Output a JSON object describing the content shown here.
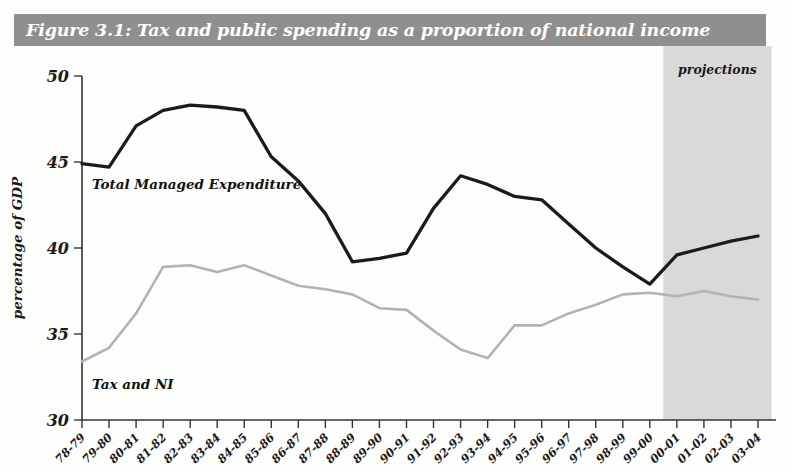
{
  "title": "Figure 3.1: Tax and public spending as a proportion of national income",
  "annotations": {
    "projections": "projections",
    "series_label_tme": "Total Managed Expenditure",
    "series_label_tax": "Tax and NI"
  },
  "colors": {
    "title_band": "#8f8f8f",
    "title_text": "#ffffff",
    "tme_line": "#1b1b1b",
    "tax_line": "#b3b3b3",
    "projection_band": "#d9d9d9",
    "axis": "#333333"
  },
  "chart_data": {
    "type": "line",
    "title": "Figure 3.1: Tax and public spending as a proportion of national income",
    "xlabel": "",
    "ylabel": "percentage of GDP",
    "ylim": [
      30,
      50
    ],
    "yticks": [
      30,
      35,
      40,
      45,
      50
    ],
    "grid": false,
    "legend": "inline-labels",
    "categories": [
      "78-79",
      "79-80",
      "80-81",
      "81-82",
      "82-83",
      "83-84",
      "84-85",
      "85-86",
      "86-87",
      "87-88",
      "88-89",
      "89-90",
      "90-91",
      "91-92",
      "92-93",
      "93-94",
      "94-95",
      "95-96",
      "96-97",
      "97-98",
      "98-99",
      "99-00",
      "00-01",
      "01-02",
      "02-03",
      "03-04"
    ],
    "series": [
      {
        "name": "Total Managed Expenditure",
        "color": "#1b1b1b",
        "values": [
          44.9,
          44.7,
          47.1,
          48.0,
          48.3,
          48.2,
          48.0,
          45.3,
          43.9,
          42.0,
          39.2,
          39.4,
          39.7,
          42.3,
          44.2,
          43.7,
          43.0,
          42.8,
          41.4,
          40.0,
          38.9,
          37.9,
          39.6,
          40.0,
          40.4,
          40.7
        ]
      },
      {
        "name": "Tax and NI",
        "color": "#b3b3b3",
        "values": [
          33.4,
          34.2,
          36.2,
          38.9,
          39.0,
          38.6,
          39.0,
          38.4,
          37.8,
          37.6,
          37.3,
          36.5,
          36.4,
          35.2,
          34.1,
          33.6,
          35.5,
          35.5,
          36.2,
          36.7,
          37.3,
          37.4,
          37.2,
          37.5,
          37.2,
          37.0
        ]
      }
    ],
    "projection_region": {
      "label": "projections",
      "start_category": "00-01",
      "end_category": "03-04"
    }
  }
}
